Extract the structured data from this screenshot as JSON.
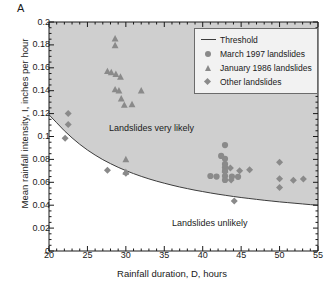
{
  "panel": {
    "label": "A"
  },
  "chart_data": {
    "type": "scatter",
    "title": "",
    "xlabel": "Rainfall duration, D, hours",
    "ylabel": "Mean rainfall intensity, I, inches per hour",
    "xlim": [
      20,
      55
    ],
    "ylim": [
      0,
      0.2
    ],
    "xticks": [
      20,
      25,
      30,
      35,
      40,
      45,
      50,
      55
    ],
    "xtick_labels": [
      "20",
      "25",
      "30",
      "35",
      "40",
      "45",
      "50",
      "55"
    ],
    "yticks": [
      0,
      0.02,
      0.04,
      0.06,
      0.08,
      0.1,
      0.12,
      0.14,
      0.16,
      0.18,
      0.2
    ],
    "ytick_labels": [
      "0",
      "0.02",
      "0.04",
      "0.06",
      "0.08",
      "0.1",
      "0.12",
      "0.14",
      "0.16",
      "0.18",
      "0.2"
    ],
    "grid": false,
    "minor_ticks": true,
    "legend_position": "top-right",
    "shaded_region_color": "#cfcfcf",
    "marker_color": "#8a8a8a",
    "threshold_color": "#3c3c3c",
    "annotations": [
      {
        "text": "Landslides very likely",
        "x": 27.8,
        "y": 0.1075
      },
      {
        "text": "Landslides unlikely",
        "x": 36.0,
        "y": 0.0245
      }
    ],
    "legend": [
      {
        "label": "Threshold",
        "marker": "line"
      },
      {
        "label": "March 1997 landslides",
        "marker": "circle"
      },
      {
        "label": "January 1986 landslides",
        "marker": "triangle"
      },
      {
        "label": "Other landslides",
        "marker": "diamond"
      }
    ],
    "series": [
      {
        "name": "Threshold",
        "marker": "line",
        "type": "curve",
        "points": [
          [
            20.0,
            0.119
          ],
          [
            21.0,
            0.112
          ],
          [
            22.0,
            0.105
          ],
          [
            23.0,
            0.0988
          ],
          [
            24.0,
            0.0932
          ],
          [
            25.0,
            0.0882
          ],
          [
            26.0,
            0.0838
          ],
          [
            27.0,
            0.0798
          ],
          [
            28.0,
            0.0763
          ],
          [
            29.0,
            0.0731
          ],
          [
            30.0,
            0.0702
          ],
          [
            31.0,
            0.0676
          ],
          [
            32.0,
            0.0652
          ],
          [
            33.0,
            0.063
          ],
          [
            34.0,
            0.061
          ],
          [
            35.0,
            0.0592
          ],
          [
            36.0,
            0.0575
          ],
          [
            37.0,
            0.0559
          ],
          [
            38.0,
            0.0545
          ],
          [
            39.0,
            0.0531
          ],
          [
            40.0,
            0.0519
          ],
          [
            41.0,
            0.0507
          ],
          [
            42.0,
            0.0496
          ],
          [
            43.0,
            0.0486
          ],
          [
            44.0,
            0.0476
          ],
          [
            45.0,
            0.0467
          ],
          [
            46.0,
            0.0459
          ],
          [
            47.0,
            0.0451
          ],
          [
            48.0,
            0.0443
          ],
          [
            49.0,
            0.0436
          ],
          [
            50.0,
            0.0429
          ],
          [
            51.0,
            0.0423
          ],
          [
            52.0,
            0.0417
          ],
          [
            53.0,
            0.0411
          ],
          [
            54.0,
            0.0405
          ],
          [
            55.0,
            0.04
          ]
        ]
      },
      {
        "name": "March 1997 landslides",
        "marker": "circle",
        "points": [
          [
            42.9,
            0.0925
          ],
          [
            42.4,
            0.083
          ],
          [
            42.9,
            0.0805
          ],
          [
            42.9,
            0.076
          ],
          [
            42.9,
            0.073
          ],
          [
            42.9,
            0.07
          ],
          [
            41.0,
            0.0655
          ],
          [
            41.8,
            0.065
          ],
          [
            42.9,
            0.0655
          ],
          [
            42.9,
            0.062
          ],
          [
            43.8,
            0.065
          ],
          [
            44.6,
            0.0648
          ]
        ]
      },
      {
        "name": "January 1986 landslides",
        "marker": "triangle",
        "points": [
          [
            28.6,
            0.1855
          ],
          [
            28.6,
            0.1795
          ],
          [
            27.6,
            0.157
          ],
          [
            28.1,
            0.156
          ],
          [
            28.7,
            0.1545
          ],
          [
            29.3,
            0.152
          ],
          [
            28.6,
            0.141
          ],
          [
            29.1,
            0.14
          ],
          [
            32.0,
            0.14
          ],
          [
            29.4,
            0.133
          ],
          [
            29.8,
            0.1275
          ],
          [
            30.8,
            0.128
          ],
          [
            30.0,
            0.08
          ],
          [
            30.0,
            0.069
          ]
        ]
      },
      {
        "name": "Other landslides",
        "marker": "diamond",
        "points": [
          [
            22.5,
            0.12
          ],
          [
            22.5,
            0.1105
          ],
          [
            22.1,
            0.0985
          ],
          [
            27.6,
            0.0705
          ],
          [
            30.0,
            0.068
          ],
          [
            43.6,
            0.0725
          ],
          [
            42.9,
            0.069
          ],
          [
            44.8,
            0.07
          ],
          [
            46.1,
            0.071
          ],
          [
            43.7,
            0.062
          ],
          [
            44.1,
            0.0437
          ],
          [
            50.0,
            0.0775
          ],
          [
            50.0,
            0.063
          ],
          [
            50.0,
            0.0555
          ],
          [
            51.8,
            0.0618
          ],
          [
            53.1,
            0.0628
          ]
        ]
      }
    ]
  }
}
